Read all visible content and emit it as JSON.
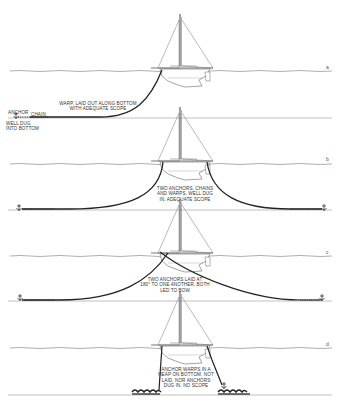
{
  "figure": {
    "panels": [
      {
        "letter": "a",
        "labels": {
          "warp": "WARP, LAID OUT ALONG BOTTOM\nWITH ADEQUATE SCOPE",
          "anchor": "ANCHOR",
          "chain": "CHAIN",
          "dug": "WELL DUG\nINTO BOTTOM"
        }
      },
      {
        "letter": "b",
        "labels": {
          "main": "TWO ANCHORS, CHAINS\nAND WARPS, WELL DUG\nIN, ADEQUATE SCOPE"
        }
      },
      {
        "letter": "c",
        "labels": {
          "main": "TWO ANCHORS LAID AT\n180° TO ONE ANOTHER, BOTH\nLED TO BOW"
        }
      },
      {
        "letter": "d",
        "labels": {
          "main": "ANCHOR WARPS IN A\nHEAP ON BOTTOM, NOT\nLAID, NOR ANCHORS\nDUG IN. NO SCOPE"
        }
      }
    ],
    "colors": {
      "line": "#222222",
      "water": "#777777",
      "bottom": "#888888",
      "background": "#ffffff"
    }
  }
}
